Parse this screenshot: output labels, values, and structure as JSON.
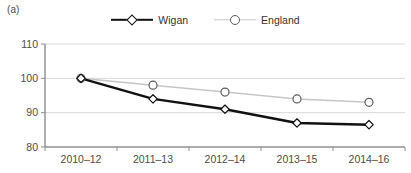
{
  "panel": {
    "label": "(a)"
  },
  "legend": {
    "position": "top-center",
    "items": [
      {
        "name": "Wigan",
        "marker": "diamond-marker-icon",
        "color": "#111111"
      },
      {
        "name": "England",
        "marker": "circle-marker-icon",
        "color": "#c6c6c6"
      }
    ]
  },
  "chart_data": {
    "type": "line",
    "title": "",
    "xlabel": "",
    "ylabel": "",
    "categories": [
      "2010–12",
      "2011–13",
      "2012–14",
      "2013–15",
      "2014–16"
    ],
    "series": [
      {
        "name": "Wigan",
        "values": [
          100,
          94,
          91,
          87,
          86.5
        ],
        "color": "#111111",
        "marker": "diamond"
      },
      {
        "name": "England",
        "values": [
          100,
          98,
          96,
          94,
          93
        ],
        "color": "#c6c6c6",
        "marker": "circle"
      }
    ],
    "ylim": [
      80,
      110
    ],
    "yticks": [
      80,
      90,
      100,
      110
    ],
    "ytick_labels": [
      "80",
      "90",
      "100",
      "110"
    ],
    "grid": true,
    "legend_position": "top-center"
  }
}
